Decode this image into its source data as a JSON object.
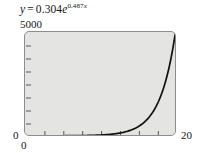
{
  "figure": {
    "background_color": "#ffffff",
    "plot_fill_color": "#e4e4e3",
    "plot_border_color": "#8d8d8d",
    "curve_color": "#111111"
  },
  "equation": {
    "lhs": "y",
    "equals": "=",
    "coefficient": "0.304",
    "base": "e",
    "exponent_coefficient": "0.487",
    "exponent_variable": "x",
    "full_text": "y = 0.304e^0.487x"
  },
  "axes": {
    "y_max_label": "5000",
    "y_min_label": "0",
    "x_min_label": "0",
    "x_max_label": "20"
  },
  "chart_data": {
    "type": "line",
    "xlabel": "",
    "ylabel": "",
    "xlim": [
      0,
      20
    ],
    "ylim": [
      0,
      5000
    ],
    "grid": false,
    "legend": null,
    "function": "y = 0.304 * e^(0.487 * x)",
    "x_ticks": [
      0,
      2.5,
      5,
      7.5,
      10,
      12.5,
      15,
      17.5,
      20
    ],
    "x_tick_labels": [
      "0",
      "",
      "",
      "",
      "",
      "",
      "",
      "",
      "20"
    ],
    "y_ticks": [
      0,
      625,
      1250,
      1875,
      2500,
      3125,
      3750,
      4375,
      5000
    ],
    "y_tick_labels": [
      "0",
      "",
      "",
      "",
      "",
      "",
      "",
      "",
      "5000"
    ],
    "series": [
      {
        "name": "y = 0.304e^0.487x",
        "x": [
          0,
          1,
          2,
          3,
          4,
          5,
          6,
          7,
          8,
          9,
          10,
          11,
          12,
          13,
          14,
          15,
          16,
          17,
          18,
          19,
          20
        ],
        "values": [
          0.3,
          0.5,
          0.8,
          1.3,
          2.1,
          3.5,
          5.7,
          9.2,
          15.0,
          24.5,
          39.9,
          65.0,
          105.9,
          172.5,
          281.1,
          458.1,
          746.4,
          1216.1,
          1981.7,
          3229.1,
          5261.7
        ]
      }
    ]
  }
}
